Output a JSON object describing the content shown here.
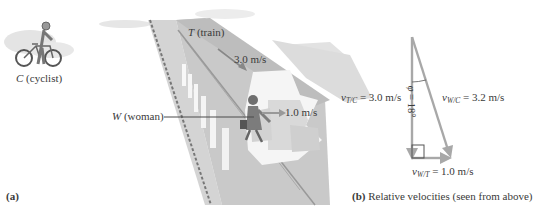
{
  "panel_a": {
    "label": "(a)",
    "cyclist": {
      "letter": "C",
      "desc": "(cyclist)"
    },
    "train": {
      "letter": "T",
      "desc": "(train)",
      "speed": "3.0 m/s"
    },
    "woman": {
      "letter": "W",
      "desc": "(woman)",
      "speed": "1.0 m/s"
    }
  },
  "panel_b": {
    "label": "(b)",
    "caption": "Relative velocities (seen from above)",
    "v_tc": {
      "symbol": "v",
      "sub": "T/C",
      "eq": "= 3.0 m/s"
    },
    "v_wc": {
      "symbol": "v",
      "sub": "W/C",
      "eq": "= 3.2 m/s"
    },
    "v_wt": {
      "symbol": "v",
      "sub": "W/T",
      "eq": "= 1.0 m/s"
    },
    "angle": {
      "symbol": "φ",
      "eq": "= 18°"
    }
  },
  "colors": {
    "vector": "#a8a8a8",
    "train_body": "#c8c8c8",
    "train_dark": "#9a9a9a",
    "text": "#3a3a3a"
  }
}
